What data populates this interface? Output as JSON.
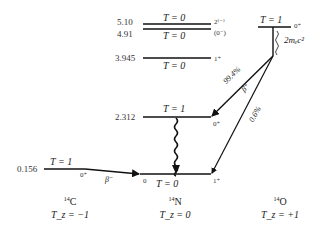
{
  "diagram": {
    "type": "nuclear-energy-level-diagram",
    "levels_n14": [
      {
        "energy": "5.10",
        "isospin": "T = 0",
        "jp": "2⁽⁻⁾"
      },
      {
        "energy": "4.91",
        "isospin": "T = 0",
        "jp": "(0⁻)"
      },
      {
        "energy": "3.945",
        "isospin": "T = 0",
        "jp": "1⁺"
      },
      {
        "energy": "2.312",
        "isospin": "T = 1",
        "jp": "0⁺"
      },
      {
        "energy": "0",
        "isospin": "T = 0",
        "jp": "1⁺"
      }
    ],
    "level_c14": {
      "energy": "0.156",
      "isospin": "T = 1",
      "jp": "0⁺"
    },
    "level_o14": {
      "isospin": "T = 1",
      "jp": "0⁺",
      "gap_label": "2mₑc²"
    },
    "transitions": {
      "c14_beta": "β⁻",
      "o14_to_2312_branch": "99.4%",
      "o14_to_2312_decay": "β⁺",
      "o14_to_ground_branch": "0.6%",
      "ground_label_zero": "0"
    },
    "nuclei": [
      {
        "mass": "14",
        "symbol": "C",
        "tz": "T_z = −1"
      },
      {
        "mass": "14",
        "symbol": "N",
        "tz": "T_z = 0"
      },
      {
        "mass": "14",
        "symbol": "O",
        "tz": "T_z = +1"
      }
    ]
  }
}
